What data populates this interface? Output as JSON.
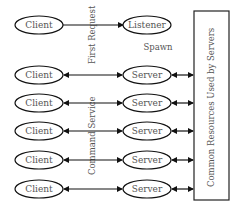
{
  "diagram": {
    "nodes": {
      "clients": [
        {
          "label": "Client"
        },
        {
          "label": "Client"
        },
        {
          "label": "Client"
        },
        {
          "label": "Client"
        },
        {
          "label": "Client"
        },
        {
          "label": "Client"
        }
      ],
      "listener": {
        "label": "Listener"
      },
      "servers": [
        {
          "label": "Server"
        },
        {
          "label": "Server"
        },
        {
          "label": "Server"
        },
        {
          "label": "Server"
        },
        {
          "label": "Server"
        }
      ],
      "resources": {
        "label": "Common Resources Used by Servers"
      }
    },
    "edge_labels": {
      "first_request": "First Request",
      "spawn": "Spawn",
      "command_service": "Command Service"
    },
    "colors": {
      "stroke": "#111111",
      "text": "#555555",
      "background": "#ffffff"
    }
  }
}
